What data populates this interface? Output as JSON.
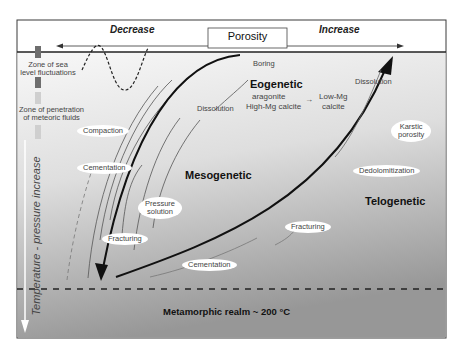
{
  "header": {
    "decrease_label": "Decrease",
    "porosity_label": "Porosity",
    "increase_label": "Increase"
  },
  "left_axis": {
    "sea_level_zone": [
      "Zone of sea",
      "level fluctuations"
    ],
    "meteoric_zone": [
      "Zone of penetration",
      "of meteoric fluids"
    ],
    "depth_axis_label": "Temperature - pressure increase"
  },
  "realms": {
    "eogenetic": "Eogenetic",
    "mesogenetic": "Mesogenetic",
    "telogenetic": "Telogenetic",
    "metamorphic": "Metamorphic realm ~ 200 °C"
  },
  "mineralogy": {
    "from_1": "aragonite",
    "from_2": "High-Mg calcite",
    "to_1": "Low-Mg",
    "to_2": "calcite"
  },
  "processes": {
    "boring": "Boring",
    "dissolution_eo": "Dissolution",
    "dissolution_telo": "Dissolution",
    "compaction": "Compaction",
    "cementation_left": "Cementation",
    "pressure_solution_1": "Pressure",
    "pressure_solution_2": "solution",
    "fracturing_left": "Fracturing",
    "cementation_bottom": "Cementation",
    "fracturing_right": "Fracturing",
    "dedolomitization": "Dedolomitization",
    "karstic_1": "Karstic",
    "karstic_2": "porosity"
  },
  "colors": {
    "frame": "#3a3a3a",
    "gradient_top": "#f7f7f7",
    "gradient_bottom": "#9a9a9a",
    "sea_level_bar": "#6e6e6e",
    "meteoric_bar": "#cfcfcf"
  }
}
